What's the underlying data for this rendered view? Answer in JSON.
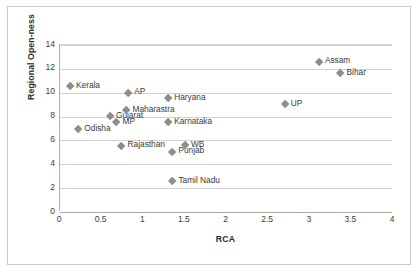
{
  "chart_data": {
    "type": "scatter",
    "title": "",
    "xlabel": "RCA",
    "ylabel": "Regional Open-ness",
    "xlim": [
      0,
      4
    ],
    "ylim": [
      0,
      14
    ],
    "xticks": [
      "0",
      "0.5",
      "1",
      "1.5",
      "2",
      "2.5",
      "3",
      "3.5",
      "4"
    ],
    "xtick_values": [
      0,
      0.5,
      1,
      1.5,
      2,
      2.5,
      3,
      3.5,
      4
    ],
    "yticks": [
      "0",
      "2",
      "4",
      "6",
      "8",
      "10",
      "12",
      "14"
    ],
    "ytick_values": [
      0,
      2,
      4,
      6,
      8,
      10,
      12,
      14
    ],
    "grid": "horizontal",
    "legend": "none",
    "marker_shape": "diamond",
    "marker_color": "#8d8d8d",
    "points": [
      {
        "label": "Kerala",
        "x": 0.12,
        "y": 10.55
      },
      {
        "label": "Odisha",
        "x": 0.22,
        "y": 6.95
      },
      {
        "label": "Gujarat",
        "x": 0.6,
        "y": 8.0
      },
      {
        "label": "MP",
        "x": 0.68,
        "y": 7.5
      },
      {
        "label": "Maharastra",
        "x": 0.8,
        "y": 8.55
      },
      {
        "label": "AP",
        "x": 0.82,
        "y": 10.0
      },
      {
        "label": "Rajasthan",
        "x": 0.74,
        "y": 5.55
      },
      {
        "label": "Karnataka",
        "x": 1.3,
        "y": 7.5
      },
      {
        "label": "Haryana",
        "x": 1.3,
        "y": 9.55
      },
      {
        "label": "Punjab",
        "x": 1.35,
        "y": 5.05
      },
      {
        "label": "Tamil Nadu",
        "x": 1.35,
        "y": 2.55
      },
      {
        "label": "WB",
        "x": 1.5,
        "y": 5.6
      },
      {
        "label": "UP",
        "x": 2.7,
        "y": 9.05
      },
      {
        "label": "Assam",
        "x": 3.11,
        "y": 12.6
      },
      {
        "label": "Bihar",
        "x": 3.37,
        "y": 11.65
      }
    ]
  }
}
